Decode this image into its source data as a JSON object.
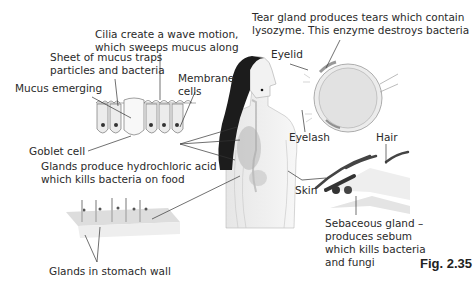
{
  "figure": {
    "caption": "Fig. 2.35",
    "labels": {
      "cilia": [
        "Cilia create a wave motion,",
        "which sweeps mucus along"
      ],
      "mucus_sheet": [
        "Sheet of mucus traps",
        "particles and bacteria"
      ],
      "mucus_emerging": "Mucus emerging",
      "membrane_cells": [
        "Membrane",
        "cells"
      ],
      "goblet_cell": "Goblet cell",
      "hcl_glands": [
        "Glands produce hydrochloric acid",
        "which kills bacteria on food"
      ],
      "stomach_glands": "Glands in stomach wall",
      "tear_gland": [
        "Tear gland produces tears which contain",
        "lysozyme. This enzyme destroys bacteria"
      ],
      "eyelid": "Eyelid",
      "eyelash": "Eyelash",
      "hair": "Hair",
      "skin": "Skin",
      "sebaceous": [
        "Sebaceous gland –",
        "produces sebum",
        "which kills bacteria",
        "and fungi"
      ]
    }
  }
}
